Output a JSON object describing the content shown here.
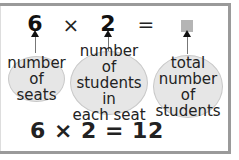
{
  "diagram": {
    "top_row": {
      "factor1": "6",
      "times": "×",
      "factor2": "2",
      "equals": "=",
      "unknown": "square-placeholder"
    },
    "labels": {
      "factor1": [
        "number",
        "of seats"
      ],
      "factor2": [
        "number of",
        "students in",
        "each seat"
      ],
      "product": [
        "total",
        "number of",
        "students"
      ]
    },
    "equation": "6 × 2 = 12"
  },
  "colors": {
    "border": "#9a9a9a",
    "bubble_fill": "#e6e6e6",
    "placeholder": "#b5b5b5"
  }
}
